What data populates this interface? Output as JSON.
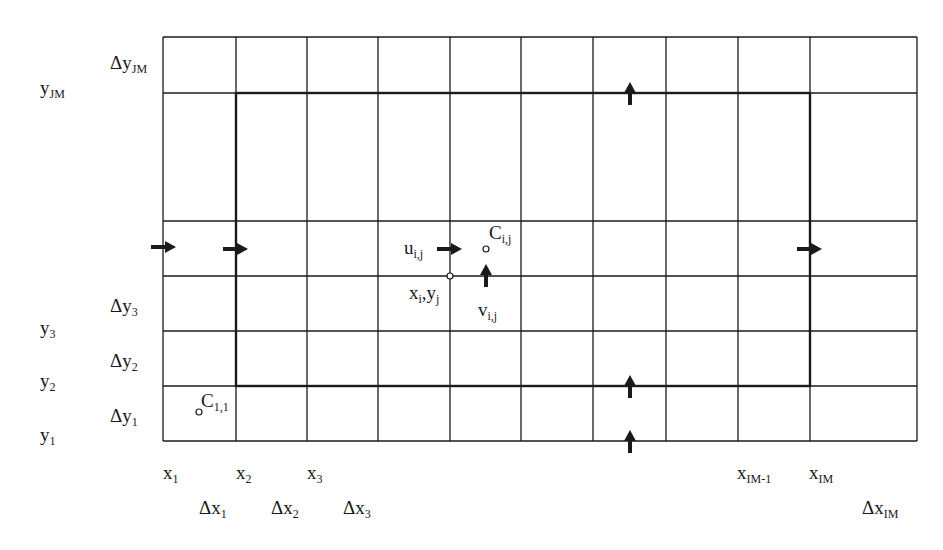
{
  "diagram": {
    "type": "staggered-grid",
    "colors": {
      "line": "#1a1a1a",
      "background": "#ffffff"
    },
    "grid": {
      "x_lines": [
        163,
        236,
        307,
        378,
        450,
        521,
        593,
        666,
        738,
        810,
        917
      ],
      "y_lines": [
        37,
        93,
        221,
        276,
        331,
        386,
        441
      ],
      "inner_boundary": {
        "x1": 236,
        "y1": 93,
        "x2": 810,
        "y2": 386
      }
    },
    "y_labels": [
      {
        "base": "y",
        "sub": "JM",
        "x": 40,
        "y": 78
      },
      {
        "base": "y",
        "sub": "3",
        "x": 40,
        "y": 318
      },
      {
        "base": "y",
        "sub": "2",
        "x": 40,
        "y": 371
      },
      {
        "base": "y",
        "sub": "1",
        "x": 40,
        "y": 425
      }
    ],
    "dy_labels": [
      {
        "base": "Δy",
        "sub": "JM",
        "x": 110,
        "y": 53
      },
      {
        "base": "Δy",
        "sub": "3",
        "x": 110,
        "y": 296
      },
      {
        "base": "Δy",
        "sub": "2",
        "x": 110,
        "y": 351
      },
      {
        "base": "Δy",
        "sub": "1",
        "x": 110,
        "y": 406
      }
    ],
    "x_labels": [
      {
        "base": "x",
        "sub": "1",
        "x": 163,
        "y": 463
      },
      {
        "base": "x",
        "sub": "2",
        "x": 236,
        "y": 463
      },
      {
        "base": "x",
        "sub": "3",
        "x": 307,
        "y": 463
      },
      {
        "base": "x",
        "sub": "IM-1",
        "x": 737,
        "y": 463
      },
      {
        "base": "x",
        "sub": "IM",
        "x": 809,
        "y": 463
      }
    ],
    "dx_labels": [
      {
        "base": "Δx",
        "sub": "1",
        "x": 199,
        "y": 498
      },
      {
        "base": "Δx",
        "sub": "2",
        "x": 271,
        "y": 498
      },
      {
        "base": "Δx",
        "sub": "3",
        "x": 343,
        "y": 498
      },
      {
        "base": "Δx",
        "sub": "IM",
        "x": 862,
        "y": 498
      }
    ],
    "annotations": [
      {
        "id": "u-ij",
        "base": "u",
        "sub": "i,j",
        "x": 404,
        "y": 238
      },
      {
        "id": "c-ij",
        "base": "C",
        "sub": "i,j",
        "x": 489,
        "y": 223
      },
      {
        "id": "xy-ij",
        "base": "x",
        "sub": "i",
        "mid": ",y",
        "sub2": "j",
        "x": 409,
        "y": 283
      },
      {
        "id": "v-ij",
        "base": "v",
        "sub": "i,j",
        "x": 478,
        "y": 300
      },
      {
        "id": "c-11",
        "base": "C",
        "sub": "1,1",
        "x": 201,
        "y": 391
      }
    ],
    "points": [
      {
        "id": "node-xi-yj",
        "cx": 450,
        "cy": 276
      },
      {
        "id": "center-cij",
        "cx": 486,
        "cy": 249
      },
      {
        "id": "center-c11",
        "cx": 199,
        "cy": 412
      }
    ],
    "arrows_right": [
      {
        "x": 151,
        "y": 247
      },
      {
        "x": 223,
        "y": 249
      },
      {
        "x": 437,
        "y": 249
      },
      {
        "x": 797,
        "y": 249
      }
    ],
    "arrows_up": [
      {
        "x": 630,
        "y": 105
      },
      {
        "x": 630,
        "y": 398
      },
      {
        "x": 630,
        "y": 453
      },
      {
        "x": 486,
        "y": 287
      }
    ]
  }
}
